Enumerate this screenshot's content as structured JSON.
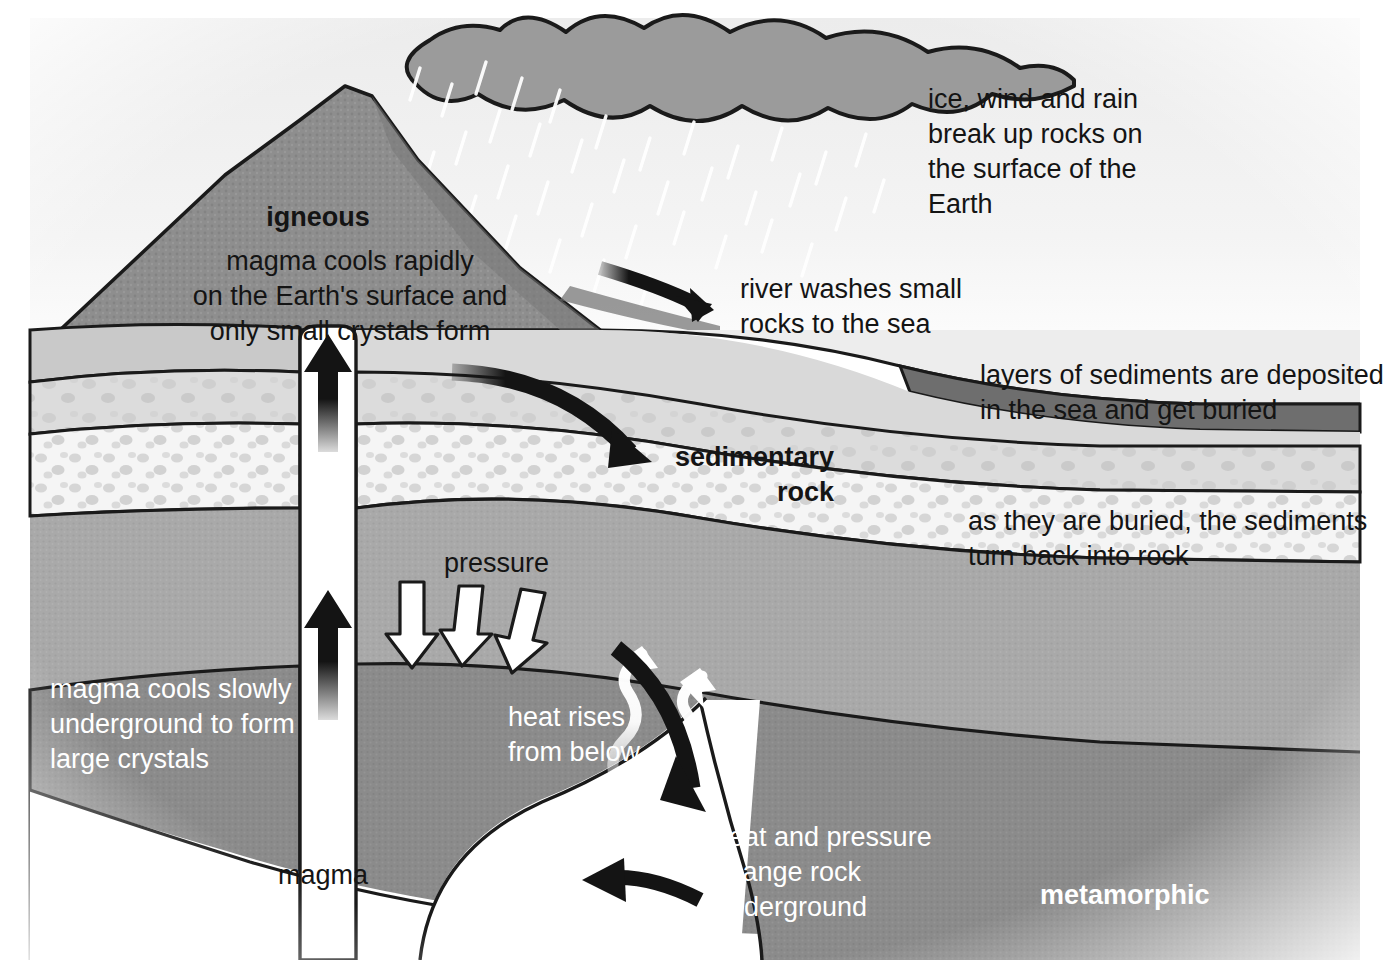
{
  "diagram": {
    "type": "geological cross-section",
    "colors": {
      "sky": "#f2f2f2",
      "cloud": "#9a9a9a",
      "volcano": "#8c8c8c",
      "volcano_dark": "#757575",
      "sediment_light": "#d8d8d8",
      "sediment_speckle": "#f4f4f4",
      "mid_rock": "#a8a8a8",
      "metamorphic": "#8a8a8a",
      "sea_floor_dark": "#707070",
      "magma_white": "#ffffff",
      "ink": "#141414",
      "label_white": "#ffffff"
    },
    "labels": {
      "igneous_title": "igneous",
      "igneous_body": "magma cools rapidly\non the Earth's surface and\nonly small crystals form",
      "weathering": "ice, wind and rain\nbreak up rocks on\nthe surface of the\nEarth",
      "river": "river washes small\nrocks to the sea",
      "deposition": "layers of sediments are deposited\nin the sea and get buried",
      "sedimentary_title": "sedimentary\nrock",
      "lithification": "as they are buried, the sediments\nturn back into rock",
      "pressure": "pressure",
      "intrusive": "magma cools slowly\nunderground to form\nlarge crystals",
      "heat_rises": "heat rises\nfrom below",
      "metamorphism": "heat and pressure\nchange rock\nunderground",
      "metamorphic_title": "metamorphic",
      "magma": "magma"
    },
    "arrows": [
      {
        "name": "magma-rise-upper",
        "style": "solid-black-straight",
        "direction": "up"
      },
      {
        "name": "magma-rise-lower",
        "style": "solid-black-straight",
        "direction": "up"
      },
      {
        "name": "river-to-sea",
        "style": "curved-black-thick",
        "direction": "right-down"
      },
      {
        "name": "sediment-burial",
        "style": "curved-black-thick",
        "direction": "right-down"
      },
      {
        "name": "pressure-1",
        "style": "white-outlined-straight",
        "direction": "down"
      },
      {
        "name": "pressure-2",
        "style": "white-outlined-straight",
        "direction": "down"
      },
      {
        "name": "pressure-3",
        "style": "white-outlined-straight",
        "direction": "down"
      },
      {
        "name": "heat-rise-1",
        "style": "white-wavy",
        "direction": "up-right"
      },
      {
        "name": "heat-rise-2",
        "style": "white-wavy",
        "direction": "up-right"
      },
      {
        "name": "metamorphism-down",
        "style": "curved-black-thick",
        "direction": "down"
      },
      {
        "name": "melt-return",
        "style": "curved-black-thick",
        "direction": "left"
      }
    ]
  }
}
